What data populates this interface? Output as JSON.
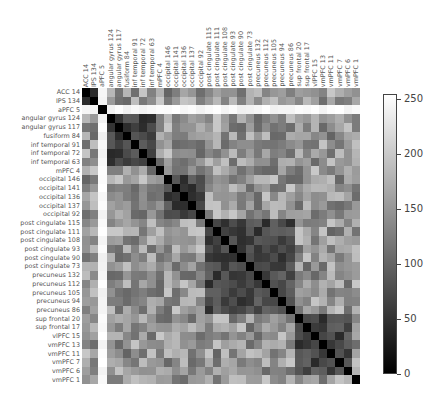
{
  "chart_data": {
    "type": "heatmap",
    "title": "",
    "xlabel": "",
    "ylabel": "",
    "labels": [
      "ACC 14",
      "IPS 134",
      "aPFC 5",
      "angular gyrus 124",
      "angular gyrus 117",
      "fusiform 84",
      "inf temporal 91",
      "inf temporal 72",
      "inf temporal 63",
      "mPFC 4",
      "occipital 146",
      "occipital 141",
      "occipital 136",
      "occipital 137",
      "occipital 92",
      "post cingulate 115",
      "post cingulate 111",
      "post cingulate 108",
      "post cingulate 93",
      "post cingulate 90",
      "post cingulate 73",
      "precuneus 132",
      "precuneus 112",
      "precuneus 105",
      "precuneus 94",
      "precuneus 86",
      "sup frontal 20",
      "sup frontal 17",
      "vlPFC 15",
      "vmPFC 13",
      "vmPFC 11",
      "vmPFC 7",
      "vmPFC 6",
      "vmPFC 1"
    ],
    "colormap": "gray",
    "colorbar": {
      "ticks": [
        0,
        50,
        100,
        150,
        200,
        250
      ],
      "range": [
        0,
        255
      ]
    },
    "groups": [
      {
        "name": "ACC/IPS",
        "indices": [
          0,
          1
        ]
      },
      {
        "name": "aPFC",
        "indices": [
          2
        ]
      },
      {
        "name": "temporal-parietal",
        "indices": [
          3,
          4,
          5,
          6,
          7,
          8
        ]
      },
      {
        "name": "mPFC",
        "indices": [
          9
        ]
      },
      {
        "name": "occipital",
        "indices": [
          10,
          11,
          12,
          13,
          14
        ]
      },
      {
        "name": "post cingulate/precuneus",
        "indices": [
          15,
          16,
          17,
          18,
          19,
          20,
          21,
          22,
          23,
          24,
          25
        ]
      },
      {
        "name": "frontal",
        "indices": [
          26,
          27,
          28,
          29,
          30,
          31,
          32
        ]
      },
      {
        "name": "vmPFC 1",
        "indices": [
          33
        ]
      }
    ]
  }
}
